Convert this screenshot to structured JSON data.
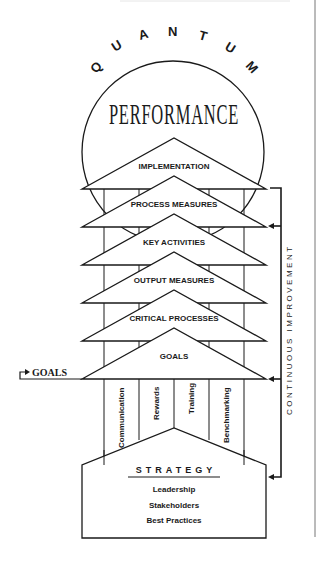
{
  "title": {
    "arc_text": "QUANTUM",
    "main_text": "PERFORMANCE"
  },
  "layers": [
    {
      "label": "IMPLEMENTATION"
    },
    {
      "label": "PROCESS MEASURES"
    },
    {
      "label": "KEY ACTIVITIES"
    },
    {
      "label": "OUTPUT MEASURES"
    },
    {
      "label": "CRITICAL PROCESSES"
    },
    {
      "label": "GOALS"
    }
  ],
  "pillars": [
    {
      "label": "Communication"
    },
    {
      "label": "Rewards"
    },
    {
      "label": "Training"
    },
    {
      "label": "Benchmarking"
    }
  ],
  "foundation": {
    "heading": "STRATEGY",
    "items": [
      "Leadership",
      "Stakeholders",
      "Best Practices"
    ]
  },
  "side_label": "CONTINUOUS IMPROVEMENT",
  "goals_input": "GOALS",
  "colors": {
    "stroke": "#1a1a1a",
    "background": "#ffffff"
  }
}
